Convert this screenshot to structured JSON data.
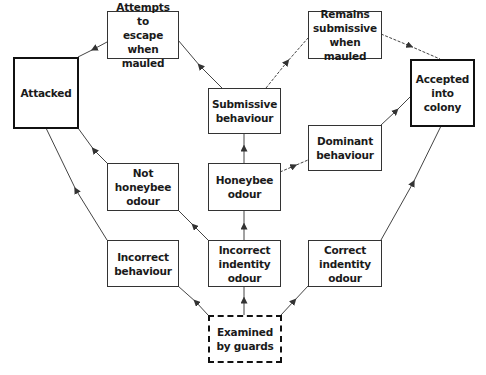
{
  "diagram": {
    "type": "flowchart",
    "nodes": {
      "attempts_escape": {
        "label": "Attempts to\nescape when\nmauled"
      },
      "remains_submissive": {
        "label": "Remains\nsubmissive\nwhen mauled"
      },
      "attacked": {
        "label": "Attacked",
        "style": "thick"
      },
      "accepted": {
        "label": "Accepted\ninto\ncolony",
        "style": "thick"
      },
      "submissive_behaviour": {
        "label": "Submissive\nbehaviour"
      },
      "not_honeybee_odour": {
        "label": "Not\nhoneybee\nodour"
      },
      "honeybee_odour": {
        "label": "Honeybee\nodour"
      },
      "dominant_behaviour": {
        "label": "Dominant\nbehaviour"
      },
      "incorrect_behaviour": {
        "label": "Incorrect\nbehaviour"
      },
      "incorrect_identity_odour": {
        "label": "Incorrect\nindentity\nodour"
      },
      "correct_identity_odour": {
        "label": "Correct\nindentity\nodour"
      },
      "examined": {
        "label": "Examined\nby guards",
        "style": "dashed"
      }
    },
    "edges": [
      {
        "from": "examined",
        "to": "incorrect_behaviour"
      },
      {
        "from": "examined",
        "to": "incorrect_identity_odour"
      },
      {
        "from": "examined",
        "to": "correct_identity_odour"
      },
      {
        "from": "incorrect_behaviour",
        "to": "attacked"
      },
      {
        "from": "incorrect_identity_odour",
        "to": "not_honeybee_odour"
      },
      {
        "from": "incorrect_identity_odour",
        "to": "honeybee_odour"
      },
      {
        "from": "not_honeybee_odour",
        "to": "attacked"
      },
      {
        "from": "honeybee_odour",
        "to": "submissive_behaviour"
      },
      {
        "from": "honeybee_odour",
        "to": "dominant_behaviour"
      },
      {
        "from": "submissive_behaviour",
        "to": "attempts_escape"
      },
      {
        "from": "submissive_behaviour",
        "to": "remains_submissive"
      },
      {
        "from": "attempts_escape",
        "to": "attacked"
      },
      {
        "from": "remains_submissive",
        "to": "accepted"
      },
      {
        "from": "dominant_behaviour",
        "to": "accepted"
      },
      {
        "from": "correct_identity_odour",
        "to": "accepted"
      }
    ]
  }
}
